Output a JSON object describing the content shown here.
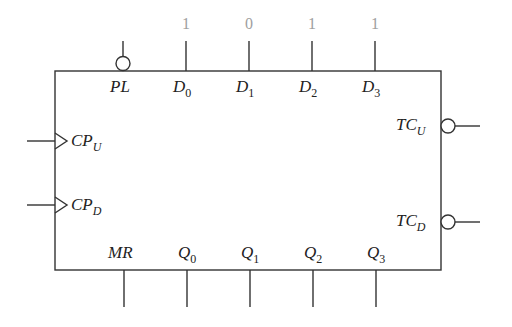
{
  "diagram": {
    "type": "4-bit up/down counter block symbol",
    "colors": {
      "line": "#333333",
      "label": "#222222",
      "value": "#a0a0a0",
      "background": "#ffffff"
    },
    "inputs_top": [
      {
        "name": "PL",
        "base": "PL",
        "sub": "",
        "inverted": true,
        "value": ""
      },
      {
        "name": "D0",
        "base": "D",
        "sub": "0",
        "inverted": false,
        "value": "1"
      },
      {
        "name": "D1",
        "base": "D",
        "sub": "1",
        "inverted": false,
        "value": "0"
      },
      {
        "name": "D2",
        "base": "D",
        "sub": "2",
        "inverted": false,
        "value": "1"
      },
      {
        "name": "D3",
        "base": "D",
        "sub": "3",
        "inverted": false,
        "value": "1"
      }
    ],
    "inputs_left": [
      {
        "name": "CPU",
        "base": "CP",
        "sub": "U",
        "clock": true
      },
      {
        "name": "CPD",
        "base": "CP",
        "sub": "D",
        "clock": true
      }
    ],
    "outputs_right": [
      {
        "name": "TCU",
        "base": "TC",
        "sub": "U",
        "inverted": true
      },
      {
        "name": "TCD",
        "base": "TC",
        "sub": "D",
        "inverted": true
      }
    ],
    "pins_bottom": [
      {
        "name": "MR",
        "base": "MR",
        "sub": ""
      },
      {
        "name": "Q0",
        "base": "Q",
        "sub": "0"
      },
      {
        "name": "Q1",
        "base": "Q",
        "sub": "1"
      },
      {
        "name": "Q2",
        "base": "Q",
        "sub": "2"
      },
      {
        "name": "Q3",
        "base": "Q",
        "sub": "3"
      }
    ]
  }
}
